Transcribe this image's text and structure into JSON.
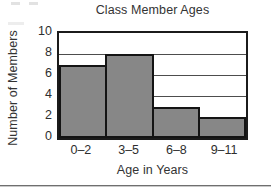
{
  "chart_data": {
    "type": "bar",
    "title": "Class Member Ages",
    "xlabel": "Age in Years",
    "ylabel": "Number of Members",
    "categories": [
      "0–2",
      "3–5",
      "6–8",
      "9–11"
    ],
    "values": [
      7,
      8,
      3,
      2
    ],
    "ylim": [
      0,
      10
    ],
    "yticks": [
      10,
      8,
      6,
      4,
      2,
      0
    ],
    "ytick_labels": [
      "10",
      "8",
      "6",
      "4",
      "2",
      "0"
    ],
    "grid": true,
    "grid_axis": "y",
    "legend": false,
    "bar_fill_color": "#878787",
    "bar_border_color": "#141414",
    "axis_color": "#1b1b1b",
    "gridline_color": "#4d4d4d",
    "background_color": "#ffffff",
    "bar_gap": 0,
    "series": [
      {
        "name": "Number of Members",
        "values": [
          7,
          8,
          3,
          2
        ]
      }
    ]
  },
  "figure": {
    "caption_rule": "",
    "artifacts_present": true
  }
}
